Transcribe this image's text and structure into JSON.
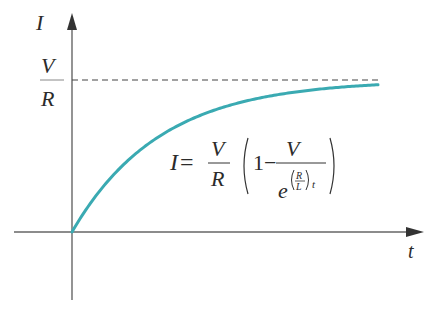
{
  "chart_data": {
    "type": "line",
    "title": "",
    "xlabel": "t",
    "ylabel": "I",
    "asymptote_label": {
      "numerator": "V",
      "denominator": "R"
    },
    "equation": {
      "lhs": "I",
      "equals": "=",
      "coef_num": "V",
      "coef_den": "R",
      "one": "1",
      "minus": "−",
      "frac_num": "V",
      "base": "e",
      "exp_num": "R",
      "exp_den": "L",
      "exp_var": "t"
    },
    "series": [
      {
        "name": "I(t) = (V/R)(1 − e^{-(R/L)t})",
        "color": "#3aaab2",
        "x": [
          0,
          0.5,
          1,
          1.5,
          2,
          2.5,
          3,
          3.5
        ],
        "y": [
          0,
          0.39,
          0.63,
          0.78,
          0.86,
          0.92,
          0.95,
          0.97
        ]
      }
    ],
    "asymptote": {
      "y": 1,
      "style": "dashed",
      "label": "V/R"
    },
    "grid": false,
    "legend": null
  },
  "colors": {
    "curve": "#3aaab2",
    "axes": "#555555",
    "dashed": "#444444"
  }
}
